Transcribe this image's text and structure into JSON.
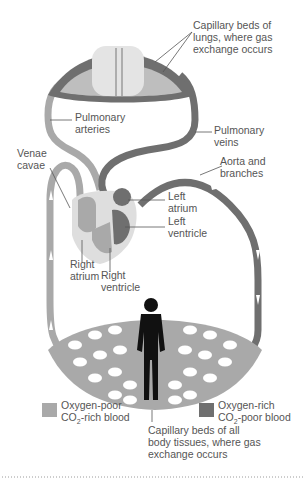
{
  "colors": {
    "oxygen_poor": "#a9a9a9",
    "oxygen_rich": "#6f6f6f",
    "lung_fill": "#e4e4e4",
    "heart_outer": "#dedede",
    "body_silhouette": "#111111",
    "text": "#555555"
  },
  "labels": {
    "lung_capillaries": [
      "Capillary beds of",
      "lungs, where gas",
      "exchange occurs"
    ],
    "pulmonary_arteries": [
      "Pulmonary",
      "arteries"
    ],
    "pulmonary_veins": [
      "Pulmonary",
      "veins"
    ],
    "venae_cavae": [
      "Venae",
      "cavae"
    ],
    "aorta": [
      "Aorta and",
      "branches"
    ],
    "left_atrium": [
      "Left",
      "atrium"
    ],
    "left_ventricle": [
      "Left",
      "ventricle"
    ],
    "right_atrium": [
      "Right",
      "atrium"
    ],
    "right_ventricle": [
      "Right",
      "ventricle"
    ],
    "body_capillaries": [
      "Capillary beds of all",
      "body tissues, where gas",
      "exchange occurs"
    ]
  },
  "legend": [
    {
      "line1": "Oxygen-poor",
      "line2_pre": "CO",
      "line2_sub": "2",
      "line2_post": "-rich blood",
      "color_key": "oxygen_poor"
    },
    {
      "line1": "Oxygen-rich",
      "line2_pre": "CO",
      "line2_sub": "2",
      "line2_post": "-poor blood",
      "color_key": "oxygen_rich"
    }
  ]
}
